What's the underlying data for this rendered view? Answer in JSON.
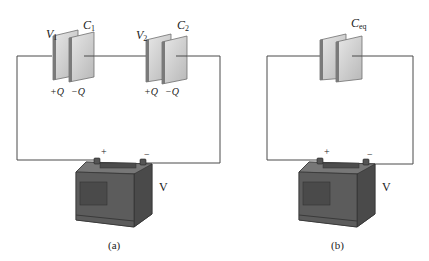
{
  "figure": {
    "panels": [
      {
        "id": "a",
        "caption": "(a)",
        "capacitors": [
          {
            "name": "C",
            "sub": "1",
            "voltage_name": "V",
            "voltage_sub": "1",
            "plus_charge": "+Q",
            "minus_charge": "−Q"
          },
          {
            "name": "C",
            "sub": "2",
            "voltage_name": "V",
            "voltage_sub": "2",
            "plus_charge": "+Q",
            "minus_charge": "−Q"
          }
        ],
        "battery": {
          "label": "V",
          "plus": "+",
          "minus": "−"
        }
      },
      {
        "id": "b",
        "caption": "(b)",
        "capacitors": [
          {
            "name": "C",
            "sub": "eq"
          }
        ],
        "battery": {
          "label": "V",
          "plus": "+",
          "minus": "−"
        }
      }
    ],
    "colors": {
      "wire": "#4a4a4a",
      "plate_face": "#d6d6d6",
      "plate_edge": "#6e6e6e",
      "battery_body": "#5a5a5a",
      "battery_dark": "#3c3c3c"
    }
  }
}
